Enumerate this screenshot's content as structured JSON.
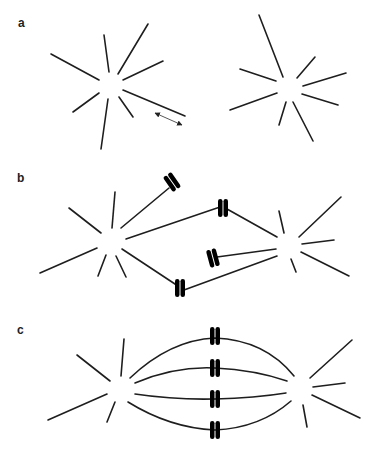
{
  "figure": {
    "panels": [
      {
        "id": "a",
        "label": "a",
        "description": "Two separated asters (centrosomes with radiating microtubules); double-headed arrow indicates microtubule growth/shrinkage dynamics"
      },
      {
        "id": "b",
        "label": "b",
        "description": "Two asters capturing chromosomes; some chromosomes attached to one pole, some bi-oriented between poles"
      },
      {
        "id": "c",
        "label": "c",
        "description": "Bipolar spindle with four bi-oriented chromosomes aligned at the metaphase plate"
      }
    ],
    "colors": {
      "line": "#1e1e1e",
      "background": "#ffffff"
    }
  }
}
